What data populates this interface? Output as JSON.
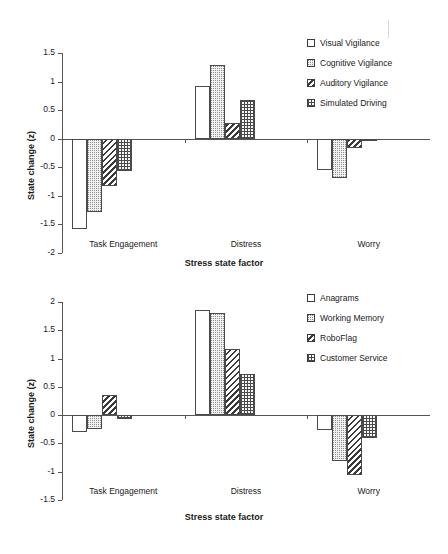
{
  "figure": {
    "background": "#ffffff",
    "axis_color": "#555555",
    "text_color": "#1a1a1a"
  },
  "chart_data": [
    {
      "type": "bar",
      "title": "",
      "panel": "top",
      "xlabel": "Stress state factor",
      "ylabel": "State change (z)",
      "categories": [
        "Task Engagement",
        "Distress",
        "Worry"
      ],
      "ylim": [
        -2,
        1.5
      ],
      "yticks": [
        1.5,
        1,
        0.5,
        0,
        -0.5,
        -1,
        -1.5,
        -2
      ],
      "yticklabels": [
        "1.5",
        "1",
        "0.5",
        "0",
        "-0.5",
        "-1",
        "-1.5",
        "-2"
      ],
      "grid": false,
      "legend_position": "top-right",
      "series": [
        {
          "name": "Visual Vigilance",
          "fill": "none",
          "values": [
            -1.58,
            0.93,
            -0.54
          ]
        },
        {
          "name": "Cognitive Vigilance",
          "fill": "dot",
          "values": [
            -1.28,
            1.29,
            -0.68
          ]
        },
        {
          "name": "Auditory Vigilance",
          "fill": "diag",
          "values": [
            -0.82,
            0.27,
            -0.17
          ]
        },
        {
          "name": "Simulated Driving",
          "fill": "grid",
          "values": [
            -0.56,
            0.68,
            -0.02
          ]
        }
      ]
    },
    {
      "type": "bar",
      "title": "",
      "panel": "bottom",
      "xlabel": "Stress state factor",
      "ylabel": "State change (z)",
      "categories": [
        "Task Engagement",
        "Distress",
        "Worry"
      ],
      "ylim": [
        -1.5,
        2
      ],
      "yticks": [
        2,
        1.5,
        1,
        0.5,
        0,
        -0.5,
        -1,
        -1.5
      ],
      "yticklabels": [
        "2",
        "1.5",
        "1",
        "0.5",
        "0",
        "-0.5",
        "-1",
        "-1.5"
      ],
      "grid": false,
      "legend_position": "top-right",
      "series": [
        {
          "name": "Anagrams",
          "fill": "none",
          "values": [
            -0.29,
            1.85,
            -0.26
          ]
        },
        {
          "name": "Working Memory",
          "fill": "dot",
          "values": [
            -0.24,
            1.81,
            -0.81
          ]
        },
        {
          "name": "RoboFlag",
          "fill": "diag",
          "values": [
            0.35,
            1.17,
            -1.05
          ]
        },
        {
          "name": "Customer Service",
          "fill": "grid",
          "values": [
            -0.07,
            0.72,
            -0.41
          ]
        }
      ]
    }
  ]
}
